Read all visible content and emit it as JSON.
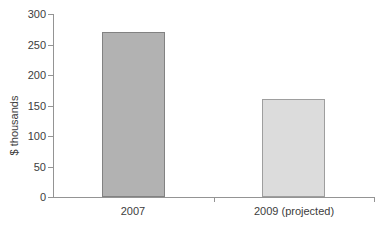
{
  "chart_data": {
    "type": "bar",
    "title": "",
    "xlabel": "",
    "ylabel": "$ thousands",
    "categories": [
      "2007",
      "2009 (projected)"
    ],
    "values": [
      270,
      160
    ],
    "ylim": [
      0,
      300
    ],
    "yticks": [
      0,
      50,
      100,
      150,
      200,
      250,
      300
    ],
    "grid": false,
    "legend": "none",
    "bar_fill_colors": [
      "#b2b2b2",
      "#dcdcdc"
    ],
    "bar_border_colors": [
      "#828282",
      "#9e9e9e"
    ],
    "axis_color": "#949494",
    "text_color": "#3d3d3d",
    "background_color": "#ffffff"
  }
}
